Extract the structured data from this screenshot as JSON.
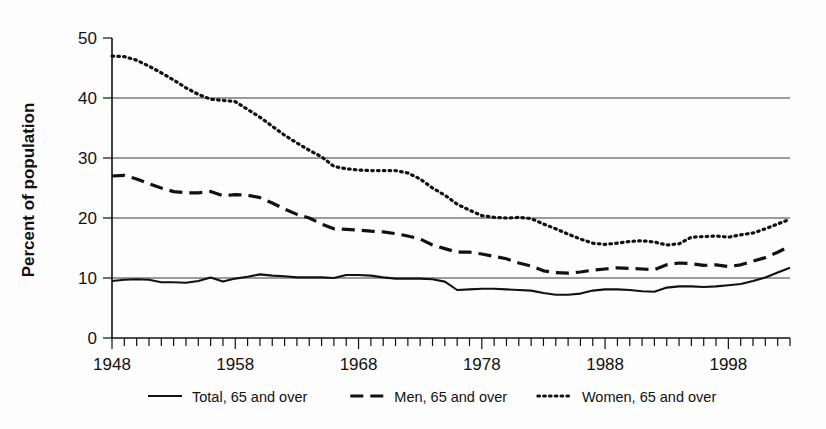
{
  "chart_data": {
    "type": "line",
    "title": "",
    "subtitle": "",
    "xlabel": "",
    "ylabel": "Percent of population",
    "xlim": [
      1948,
      2003
    ],
    "ylim": [
      0,
      50
    ],
    "yticks": [
      0,
      10,
      20,
      30,
      40,
      50
    ],
    "ytick_labels": [
      "0",
      "10",
      "20",
      "30",
      "40",
      "50"
    ],
    "xticks_labeled": [
      1948,
      1958,
      1968,
      1978,
      1988,
      1998
    ],
    "xtick_labels": [
      "1948",
      "1958",
      "1968",
      "1978",
      "1988",
      "1998"
    ],
    "xtick_interval_minor": 1,
    "gridlines": [
      10,
      20,
      30,
      40
    ],
    "grid": true,
    "legend_position": "bottom",
    "x": [
      1948,
      1949,
      1950,
      1951,
      1952,
      1953,
      1954,
      1955,
      1956,
      1957,
      1958,
      1959,
      1960,
      1961,
      1962,
      1963,
      1964,
      1965,
      1966,
      1967,
      1968,
      1969,
      1970,
      1971,
      1972,
      1973,
      1974,
      1975,
      1976,
      1977,
      1978,
      1979,
      1980,
      1981,
      1982,
      1983,
      1984,
      1985,
      1986,
      1987,
      1988,
      1989,
      1990,
      1991,
      1992,
      1993,
      1994,
      1995,
      1996,
      1997,
      1998,
      1999,
      2000,
      2001,
      2002,
      2003
    ],
    "series": [
      {
        "name": "Total, 65 and over",
        "style": "solid",
        "color": "#111111",
        "values": [
          9.5,
          9.7,
          9.8,
          9.7,
          9.3,
          9.3,
          9.2,
          9.5,
          10.1,
          9.4,
          9.9,
          10.2,
          10.6,
          10.4,
          10.3,
          10.1,
          10.1,
          10.1,
          10.0,
          10.5,
          10.5,
          10.4,
          10.1,
          9.9,
          9.9,
          9.9,
          9.8,
          9.4,
          8.0,
          8.1,
          8.2,
          8.2,
          8.1,
          8.0,
          7.9,
          7.5,
          7.2,
          7.2,
          7.4,
          7.9,
          8.1,
          8.1,
          8.0,
          7.8,
          7.7,
          8.4,
          8.6,
          8.6,
          8.5,
          8.6,
          8.8,
          9.0,
          9.5,
          10.1,
          10.9,
          11.7
        ]
      },
      {
        "name": "Men, 65 and over",
        "style": "dashed",
        "color": "#111111",
        "values": [
          27.0,
          27.1,
          26.5,
          25.7,
          25.0,
          24.4,
          24.2,
          24.2,
          24.4,
          23.7,
          23.9,
          23.8,
          23.4,
          22.5,
          21.5,
          20.6,
          20.0,
          19.0,
          18.2,
          18.1,
          18.0,
          17.8,
          17.7,
          17.4,
          17.0,
          16.5,
          15.5,
          14.9,
          14.3,
          14.3,
          14.0,
          13.6,
          13.2,
          12.5,
          12.0,
          11.2,
          10.9,
          10.8,
          11.0,
          11.3,
          11.5,
          11.7,
          11.6,
          11.5,
          11.4,
          12.2,
          12.5,
          12.4,
          12.1,
          12.2,
          11.9,
          12.2,
          12.8,
          13.4,
          14.3,
          15.3
        ]
      },
      {
        "name": "Women, 65 and over",
        "style": "dotted",
        "color": "#111111",
        "values": [
          47.0,
          46.9,
          46.3,
          45.3,
          44.2,
          43.0,
          41.7,
          40.6,
          39.8,
          39.6,
          39.4,
          38.1,
          36.8,
          35.3,
          33.8,
          32.5,
          31.3,
          30.2,
          28.6,
          28.2,
          28.0,
          27.9,
          27.9,
          27.9,
          27.5,
          26.5,
          25.0,
          23.8,
          22.3,
          21.3,
          20.4,
          20.1,
          20.0,
          20.1,
          19.9,
          19.0,
          18.2,
          17.3,
          16.5,
          15.8,
          15.6,
          15.8,
          16.1,
          16.2,
          16.0,
          15.5,
          15.7,
          16.8,
          16.9,
          17.0,
          16.8,
          17.2,
          17.5,
          18.2,
          19.0,
          19.8
        ]
      }
    ]
  },
  "legend": {
    "items": [
      {
        "label": "Total, 65 and over",
        "style": "solid"
      },
      {
        "label": "Men, 65 and over",
        "style": "dashed"
      },
      {
        "label": "Women, 65 and over",
        "style": "dotted"
      }
    ]
  },
  "axes": {
    "y_axis_title": "Percent of population"
  }
}
